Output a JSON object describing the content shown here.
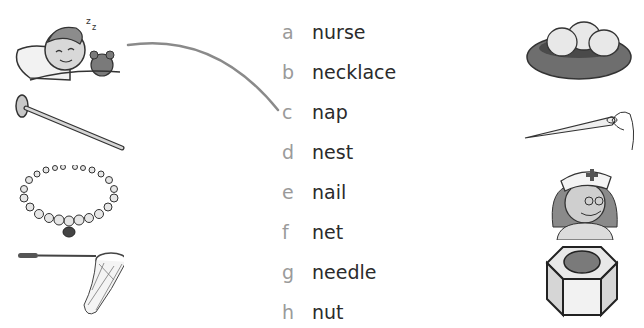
{
  "worksheet": {
    "words": [
      {
        "letter": "a",
        "word": "nurse"
      },
      {
        "letter": "b",
        "word": "necklace"
      },
      {
        "letter": "c",
        "word": "nap"
      },
      {
        "letter": "d",
        "word": "nest"
      },
      {
        "letter": "e",
        "word": "nail"
      },
      {
        "letter": "f",
        "word": "net"
      },
      {
        "letter": "g",
        "word": "needle"
      },
      {
        "letter": "h",
        "word": "nut"
      }
    ],
    "left_pictures": [
      "sleeping-child (nap)",
      "nail",
      "necklace",
      "net"
    ],
    "right_pictures": [
      "nest",
      "needle",
      "nurse",
      "nut"
    ],
    "match_line": {
      "from": "sleeping-child",
      "to": "c"
    },
    "colors": {
      "letter": "#9a9a9a",
      "word": "#2b2b2b",
      "line": "#8a8a8a"
    }
  }
}
